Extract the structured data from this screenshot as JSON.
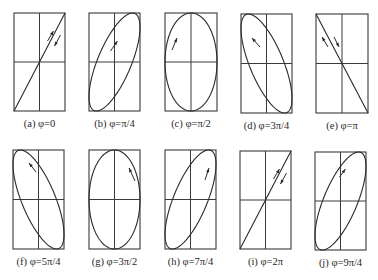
{
  "panels": [
    {
      "id": "a",
      "label": "(a) φ=0",
      "phi_over_pi": 0,
      "box": [
        14,
        13,
        51,
        98
      ],
      "shape": "line-positive",
      "arrows": "both-along-line"
    },
    {
      "id": "b",
      "label": "(b) φ=π/4",
      "phi_over_pi": 0.25,
      "box": [
        89,
        13,
        51,
        98
      ],
      "shape": "ellipse-positive-tilt",
      "arrows": "clockwise"
    },
    {
      "id": "c",
      "label": "(c) φ=π/2",
      "phi_over_pi": 0.5,
      "box": [
        165,
        13,
        52,
        98
      ],
      "shape": "upright-ellipse",
      "arrows": "clockwise"
    },
    {
      "id": "d",
      "label": "(d) φ=3π/4",
      "phi_over_pi": 0.75,
      "box": [
        241,
        14,
        51,
        99
      ],
      "shape": "ellipse-negative-tilt",
      "arrows": "clockwise"
    },
    {
      "id": "e",
      "label": "(e) φ=π",
      "phi_over_pi": 1,
      "box": [
        316,
        14,
        52,
        99
      ],
      "shape": "line-negative",
      "arrows": "both-along-line"
    },
    {
      "id": "f",
      "label": "(f) φ=5π/4",
      "phi_over_pi": 1.25,
      "box": [
        13,
        150,
        51,
        99
      ],
      "shape": "ellipse-negative-tilt",
      "arrows": "counterclockwise"
    },
    {
      "id": "g",
      "label": "(g) φ=3π/2",
      "phi_over_pi": 1.5,
      "box": [
        89,
        150,
        51,
        99
      ],
      "shape": "upright-ellipse",
      "arrows": "counterclockwise"
    },
    {
      "id": "h",
      "label": "(h) φ=7π/4",
      "phi_over_pi": 1.75,
      "box": [
        165,
        150,
        51,
        99
      ],
      "shape": "ellipse-positive-tilt",
      "arrows": "counterclockwise"
    },
    {
      "id": "i",
      "label": "(i) φ=2π",
      "phi_over_pi": 2,
      "box": [
        240,
        151,
        51,
        98
      ],
      "shape": "line-positive",
      "arrows": "both-along-line"
    },
    {
      "id": "j",
      "label": "(j) φ=9π/4",
      "phi_over_pi": 2.25,
      "box": [
        315,
        152,
        51,
        98
      ],
      "shape": "ellipse-positive-tilt",
      "arrows": "clockwise"
    }
  ],
  "colors": {
    "stroke": "#2a2a2a",
    "frame": "#3a3a3a",
    "background": "#ffffff"
  }
}
